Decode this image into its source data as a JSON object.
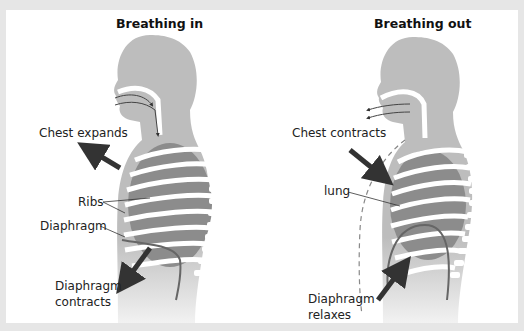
{
  "panels": [
    {
      "title": "Breathing in",
      "labels": {
        "chest": "Chest expands",
        "ribs": "Ribs",
        "diaphragm": "Diaphragm",
        "diaphragm_action_1": "Diaphragm",
        "diaphragm_action_2": "contracts"
      }
    },
    {
      "title": "Breathing out",
      "labels": {
        "chest": "Chest contracts",
        "lung": "lung",
        "diaphragm_action_1": "Diaphragm",
        "diaphragm_action_2": "relaxes"
      }
    }
  ],
  "colors": {
    "body": "#bdbdbd",
    "lung": "#8c8c8c",
    "bone": "#ffffff",
    "arrow": "#333333",
    "background": "#ffffff",
    "frame": "#e6e6e6"
  }
}
